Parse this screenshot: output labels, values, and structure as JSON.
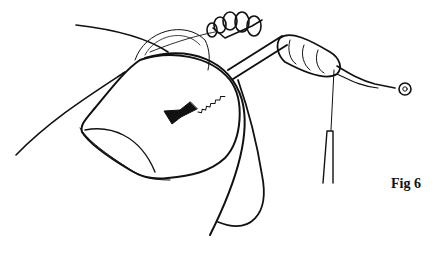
{
  "figure": {
    "label": "Fig 6",
    "colors": {
      "ink": "#111111",
      "background": "#ffffff"
    }
  }
}
